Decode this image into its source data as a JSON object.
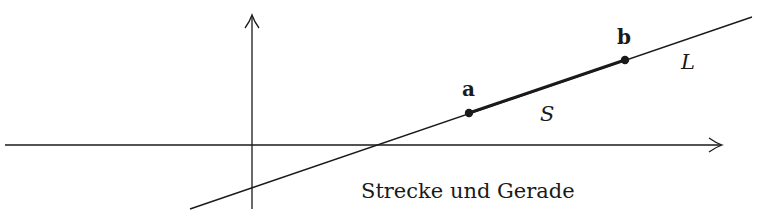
{
  "diagram": {
    "caption": "Strecke und Gerade",
    "points": [
      {
        "id": "a",
        "label": "a",
        "x": 469,
        "y": 113
      },
      {
        "id": "b",
        "label": "b",
        "x": 625,
        "y": 60
      }
    ],
    "segment_label": "S",
    "line_label": "L",
    "axes": {
      "x_axis": {
        "from": [
          5,
          145
        ],
        "to": [
          722,
          145
        ]
      },
      "y_axis": {
        "from": [
          252,
          209
        ],
        "to": [
          252,
          15
        ]
      }
    },
    "line": {
      "from": [
        190,
        209
      ],
      "to": [
        752,
        17
      ]
    },
    "colors": {
      "stroke": "#1a1a1a",
      "background": "#ffffff"
    }
  }
}
